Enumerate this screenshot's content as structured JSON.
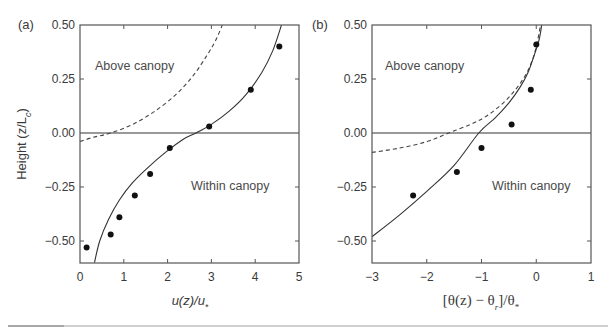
{
  "chart_data": [
    {
      "panel": "(a)",
      "type": "line",
      "title": "",
      "xlabel": "u(z)/u*",
      "ylabel": "Height (z/Lc)",
      "xlim": [
        0,
        5
      ],
      "ylim": [
        -0.6,
        0.5
      ],
      "xticks": [
        0,
        1,
        2,
        3,
        4,
        5
      ],
      "xtick_labels": [
        "0",
        "1",
        "2",
        "3",
        "4",
        "5"
      ],
      "yticks": [
        0.5,
        0.25,
        0.0,
        -0.25,
        -0.5
      ],
      "ytick_labels": [
        "0.50",
        "0.25",
        "0.00",
        "−0.25",
        "−0.50"
      ],
      "grid": false,
      "annotations": [
        "Above canopy",
        "Within canopy"
      ],
      "reference_line": {
        "y": 0.0,
        "style": "solid-gray"
      },
      "series": [
        {
          "name": "observations",
          "style": "scatter-filled-circles",
          "x": [
            0.15,
            0.7,
            0.9,
            1.25,
            1.6,
            2.05,
            2.95,
            3.9,
            4.55
          ],
          "y": [
            -0.53,
            -0.47,
            -0.39,
            -0.29,
            -0.19,
            -0.07,
            0.03,
            0.2,
            0.4
          ]
        },
        {
          "name": "model (solid)",
          "style": "solid-line",
          "x": [
            0.33,
            0.45,
            0.65,
            0.9,
            1.2,
            1.55,
            1.95,
            2.35,
            2.65,
            3.0,
            3.4,
            3.8,
            4.15,
            4.4,
            4.6
          ],
          "y": [
            -0.6,
            -0.5,
            -0.4,
            -0.31,
            -0.23,
            -0.16,
            -0.09,
            -0.03,
            0.0,
            0.04,
            0.1,
            0.18,
            0.28,
            0.38,
            0.5
          ]
        },
        {
          "name": "log-law (dashed)",
          "style": "dashed-line",
          "x": [
            0.0,
            0.3,
            0.7,
            1.2,
            1.7,
            2.2,
            2.6,
            2.9,
            3.1,
            3.25
          ],
          "y": [
            -0.04,
            -0.02,
            0.0,
            0.04,
            0.1,
            0.18,
            0.27,
            0.36,
            0.43,
            0.5
          ]
        }
      ]
    },
    {
      "panel": "(b)",
      "type": "line",
      "title": "",
      "xlabel": "[θ(z) − θr]/θ*",
      "ylabel": "",
      "xlim": [
        -3,
        1
      ],
      "ylim": [
        -0.6,
        0.5
      ],
      "xticks": [
        -3,
        -2,
        -1,
        0,
        1
      ],
      "xtick_labels": [
        "−3",
        "−2",
        "−1",
        "0",
        "1"
      ],
      "yticks": [
        0.5,
        0.25,
        0.0,
        -0.25,
        -0.5
      ],
      "ytick_labels": [
        "0.50",
        "0.25",
        "0.00",
        "−0.25",
        "−0.50"
      ],
      "grid": false,
      "annotations": [
        "Above canopy",
        "Within canopy"
      ],
      "reference_line": {
        "y": 0.0,
        "style": "solid-gray"
      },
      "series": [
        {
          "name": "observations",
          "style": "scatter-filled-circles",
          "x": [
            -2.25,
            -1.45,
            -1.0,
            -0.45,
            -0.1,
            0.0
          ],
          "y": [
            -0.29,
            -0.18,
            -0.07,
            0.04,
            0.2,
            0.41
          ]
        },
        {
          "name": "model (solid)",
          "style": "solid-line",
          "x": [
            -3.0,
            -2.5,
            -2.0,
            -1.5,
            -1.05,
            -0.75,
            -0.5,
            -0.3,
            -0.15,
            -0.05,
            0.05,
            0.1
          ],
          "y": [
            -0.48,
            -0.38,
            -0.27,
            -0.15,
            0.0,
            0.07,
            0.14,
            0.21,
            0.28,
            0.35,
            0.43,
            0.5
          ]
        },
        {
          "name": "log-law (dashed)",
          "style": "dashed-line",
          "x": [
            -3.0,
            -2.5,
            -2.0,
            -1.6,
            -1.2,
            -0.9,
            -0.6,
            -0.35,
            -0.15,
            -0.02,
            0.08
          ],
          "y": [
            -0.09,
            -0.07,
            -0.04,
            0.0,
            0.04,
            0.08,
            0.14,
            0.21,
            0.29,
            0.38,
            0.5
          ]
        }
      ]
    }
  ],
  "figure": {
    "panel_a": {
      "label": "(a)",
      "ylabel_main": "Height (z/L",
      "ylabel_sub": "c",
      "ylabel_close": ")",
      "xlabel_main": "u(z)/u",
      "xlabel_sub": "*",
      "above_label": "Above canopy",
      "within_label": "Within canopy",
      "xtick_labels": [
        "0",
        "1",
        "2",
        "3",
        "4",
        "5"
      ],
      "ytick_labels": [
        "0.50",
        "0.25",
        "0.00",
        "−0.25",
        "−0.50"
      ]
    },
    "panel_b": {
      "label": "(b)",
      "xlabel_part1": "[θ(z) − θ",
      "xlabel_sub1": "r",
      "xlabel_part2": "]/θ",
      "xlabel_sub2": "*",
      "above_label": "Above canopy",
      "within_label": "Within canopy",
      "xtick_labels": [
        "−3",
        "−2",
        "−1",
        "0",
        "1"
      ],
      "ytick_labels": [
        "0.50",
        "0.25",
        "0.00",
        "−0.25",
        "−0.50"
      ]
    },
    "colors": {
      "axes": "#555555",
      "curve": "#333333",
      "dashed": "#444444",
      "points": "#111111",
      "zero_line": "#777777"
    }
  }
}
